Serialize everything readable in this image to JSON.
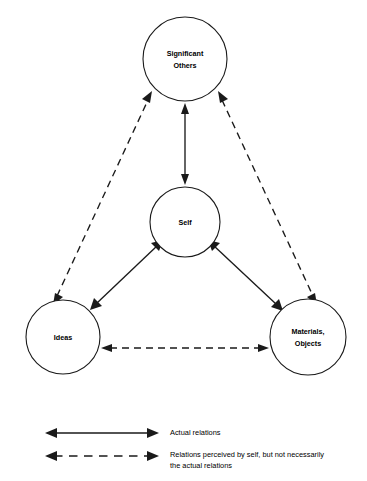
{
  "diagram": {
    "background_color": "#ffffff",
    "line_color": "#1a1a1a",
    "nodes": [
      {
        "id": "significant-others",
        "label_line1": "Significant",
        "label_line2": "Others",
        "cx": 185,
        "cy": 59,
        "r": 42
      },
      {
        "id": "self",
        "label_line1": "Self",
        "label_line2": "",
        "cx": 185,
        "cy": 222,
        "r": 35
      },
      {
        "id": "ideas",
        "label_line1": "Ideas",
        "label_line2": "",
        "cx": 63,
        "cy": 337,
        "r": 37
      },
      {
        "id": "materials-objects",
        "label_line1": "Materials,",
        "label_line2": "Objects",
        "cx": 308,
        "cy": 337,
        "r": 38
      }
    ],
    "edges": [
      {
        "id": "self-significant-others",
        "from": "self",
        "to": "significant-others",
        "style": "solid",
        "arrows": "both",
        "relation": "actual"
      },
      {
        "id": "self-ideas",
        "from": "self",
        "to": "ideas",
        "style": "solid",
        "arrows": "both",
        "relation": "actual"
      },
      {
        "id": "self-materials-objects",
        "from": "self",
        "to": "materials-objects",
        "style": "solid",
        "arrows": "both",
        "relation": "actual"
      },
      {
        "id": "ideas-significant-others",
        "from": "ideas",
        "to": "significant-others",
        "style": "dashed",
        "arrows": "both",
        "relation": "perceived"
      },
      {
        "id": "materials-objects-significant-others",
        "from": "materials-objects",
        "to": "significant-others",
        "style": "dashed",
        "arrows": "both",
        "relation": "perceived"
      },
      {
        "id": "ideas-materials-objects",
        "from": "ideas",
        "to": "materials-objects",
        "style": "dashed",
        "arrows": "both",
        "relation": "perceived"
      }
    ]
  },
  "legend": {
    "items": [
      {
        "id": "actual-relations",
        "style": "solid",
        "label_line1": "Actual relations",
        "label_line2": ""
      },
      {
        "id": "perceived-relations",
        "style": "dashed",
        "label_line1": "Relations perceived by self, but not necessarily",
        "label_line2": "the actual relations"
      }
    ]
  }
}
